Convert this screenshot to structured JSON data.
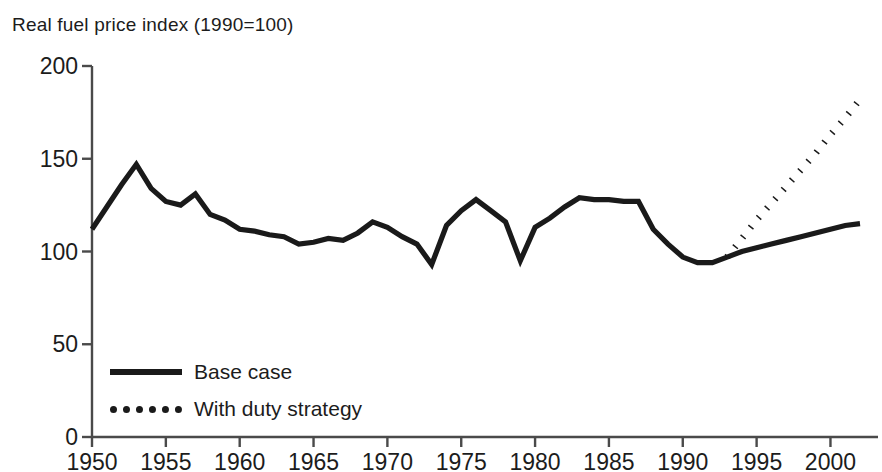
{
  "chart_data": {
    "type": "line",
    "title": "Real fuel price index (1990=100)",
    "xlabel": "",
    "ylabel": "",
    "xlim": [
      1950,
      2002
    ],
    "ylim": [
      0,
      200
    ],
    "grid": false,
    "legend_position": "inside-bottom-left",
    "x_ticks": [
      "1950",
      "1955",
      "1960",
      "1965",
      "1970",
      "1975",
      "1980",
      "1985",
      "1990",
      "1995",
      "2000"
    ],
    "y_ticks": [
      "0",
      "50",
      "100",
      "150",
      "200"
    ],
    "x_tick_values": [
      1950,
      1955,
      1960,
      1965,
      1970,
      1975,
      1980,
      1985,
      1990,
      1995,
      2000
    ],
    "y_tick_values": [
      0,
      50,
      100,
      150,
      200
    ],
    "line_color": "#1a1a1a",
    "series": [
      {
        "name": "Base case",
        "style": "solid",
        "x": [
          1950,
          1951,
          1952,
          1953,
          1954,
          1955,
          1956,
          1957,
          1958,
          1959,
          1960,
          1961,
          1962,
          1963,
          1964,
          1965,
          1966,
          1967,
          1968,
          1969,
          1970,
          1971,
          1972,
          1973,
          1974,
          1975,
          1976,
          1977,
          1978,
          1979,
          1980,
          1981,
          1982,
          1983,
          1984,
          1985,
          1986,
          1987,
          1988,
          1989,
          1990,
          1991,
          1992,
          1993,
          1994,
          1995,
          1996,
          1997,
          1998,
          1999,
          2000,
          2001,
          2002
        ],
        "y": [
          112,
          124,
          136,
          147,
          134,
          127,
          125,
          131,
          120,
          117,
          112,
          111,
          109,
          108,
          104,
          105,
          107,
          106,
          110,
          116,
          113,
          108,
          104,
          93,
          114,
          122,
          128,
          122,
          116,
          95,
          113,
          118,
          124,
          129,
          128,
          128,
          127,
          127,
          112,
          104,
          97,
          94,
          94,
          97,
          100,
          102,
          104,
          106,
          108,
          110,
          112,
          114,
          115
        ]
      },
      {
        "name": "With duty strategy",
        "style": "dotted",
        "x": [
          1993,
          1994,
          1995,
          1996,
          1997,
          1998,
          1999,
          2000,
          2001,
          2002
        ],
        "y": [
          97,
          107,
          117,
          126,
          135,
          144,
          153,
          163,
          172,
          182
        ]
      }
    ]
  },
  "legend": {
    "items": [
      {
        "label": "Base case",
        "style": "solid"
      },
      {
        "label": "With duty strategy",
        "style": "dotted"
      }
    ]
  }
}
